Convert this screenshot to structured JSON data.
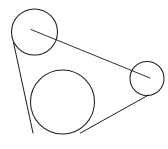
{
  "figure": {
    "background_color": "#ffffff",
    "stroke_color": "#1d1d1d",
    "width": 168,
    "height": 149
  },
  "chart_data": {
    "type": "diagram",
    "xlabel": "",
    "ylabel": "",
    "xlim": [
      0,
      168
    ],
    "ylim": [
      0,
      149
    ],
    "grid": false,
    "legend": "none",
    "units": "pixels",
    "circles": [
      {
        "name": "top-left-circle",
        "cx": 34.5,
        "cy": 32,
        "r": 23,
        "stroke": "#1d1d1d",
        "fill": "none"
      },
      {
        "name": "large-bottom-circle",
        "cx": 62.5,
        "cy": 102,
        "r": 32,
        "stroke": "#1d1d1d",
        "fill": "none"
      },
      {
        "name": "right-small-circle",
        "cx": 147,
        "cy": 78.5,
        "r": 17,
        "stroke": "#1d1d1d",
        "fill": "none"
      }
    ],
    "lines": [
      {
        "name": "left-tangent-line",
        "x1": 13.5,
        "y1": 42.5,
        "x2": 33.0,
        "y2": 133.0,
        "role": "external tangent: top-left circle to large circle"
      },
      {
        "name": "upper-right-tangent-line",
        "x1": 31.0,
        "y1": 29.5,
        "x2": 150.0,
        "y2": 78.0,
        "role": "external tangent: top-left circle to right circle"
      },
      {
        "name": "lower-right-tangent-line",
        "x1": 80.5,
        "y1": 133.0,
        "x2": 148.5,
        "y2": 95.0,
        "role": "external tangent: large circle to right circle"
      }
    ]
  }
}
